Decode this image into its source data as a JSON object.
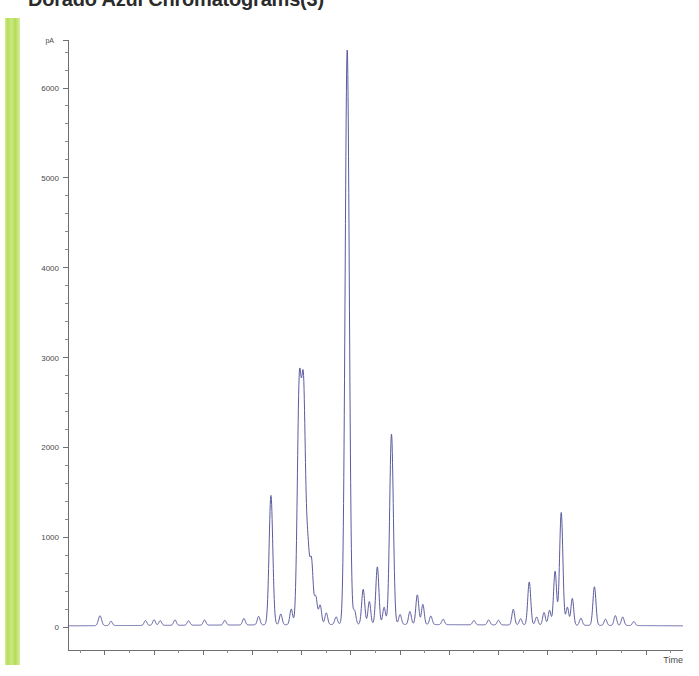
{
  "slide": {
    "title": "Dorado Azul Chromatograms(3)",
    "accent_color": "#b6de5e"
  },
  "chart_data": {
    "type": "line",
    "title": "Dorado Azul Chromatograms(3)",
    "xlabel": "Time",
    "ylabel": "pA",
    "y_unit": "pA",
    "trace_color": "#5b5b9e",
    "axis_color": "#6f6f6f",
    "grid": false,
    "legend": null,
    "xlim": [
      0,
      100
    ],
    "ylim": [
      -180,
      6700
    ],
    "ytick_labels": [
      "0",
      "1000",
      "2000",
      "3000",
      "4000",
      "5000",
      "6000"
    ],
    "yticks": [
      0,
      1000,
      2000,
      3000,
      4000,
      5000,
      6000
    ],
    "y_minor_tick_step": 200,
    "xticks": [
      2,
      6,
      10,
      14,
      18,
      22,
      26,
      30,
      34,
      38,
      42,
      46,
      50,
      54,
      58,
      62,
      66,
      70,
      74,
      78,
      82,
      86,
      90,
      94,
      98
    ],
    "xtick_labels": [],
    "x_major_every": 2,
    "baseline": 30,
    "peaks": [
      {
        "x": 5.2,
        "y": 110,
        "w": 0.35
      },
      {
        "x": 7.0,
        "y": 48,
        "w": 0.3
      },
      {
        "x": 12.6,
        "y": 55,
        "w": 0.3
      },
      {
        "x": 14.0,
        "y": 62,
        "w": 0.3
      },
      {
        "x": 15.0,
        "y": 52,
        "w": 0.3
      },
      {
        "x": 17.4,
        "y": 60,
        "w": 0.3
      },
      {
        "x": 19.6,
        "y": 50,
        "w": 0.3
      },
      {
        "x": 22.2,
        "y": 58,
        "w": 0.3
      },
      {
        "x": 25.5,
        "y": 52,
        "w": 0.3
      },
      {
        "x": 28.6,
        "y": 72,
        "w": 0.3
      },
      {
        "x": 31.0,
        "y": 95,
        "w": 0.3
      },
      {
        "x": 33.0,
        "y": 1440,
        "w": 0.4
      },
      {
        "x": 34.6,
        "y": 120,
        "w": 0.3
      },
      {
        "x": 36.3,
        "y": 175,
        "w": 0.3
      },
      {
        "x": 37.6,
        "y": 2580,
        "w": 0.42
      },
      {
        "x": 38.3,
        "y": 2550,
        "w": 0.42
      },
      {
        "x": 39.0,
        "y": 760,
        "w": 0.35
      },
      {
        "x": 39.6,
        "y": 690,
        "w": 0.35
      },
      {
        "x": 40.3,
        "y": 300,
        "w": 0.32
      },
      {
        "x": 41.0,
        "y": 215,
        "w": 0.32
      },
      {
        "x": 42.0,
        "y": 130,
        "w": 0.3
      },
      {
        "x": 43.6,
        "y": 85,
        "w": 0.3
      },
      {
        "x": 45.4,
        "y": 6400,
        "w": 0.45
      },
      {
        "x": 46.6,
        "y": 150,
        "w": 0.3
      },
      {
        "x": 48.0,
        "y": 390,
        "w": 0.33
      },
      {
        "x": 49.0,
        "y": 255,
        "w": 0.3
      },
      {
        "x": 50.3,
        "y": 640,
        "w": 0.34
      },
      {
        "x": 51.4,
        "y": 190,
        "w": 0.3
      },
      {
        "x": 52.6,
        "y": 2120,
        "w": 0.4
      },
      {
        "x": 54.0,
        "y": 110,
        "w": 0.3
      },
      {
        "x": 55.6,
        "y": 145,
        "w": 0.3
      },
      {
        "x": 56.8,
        "y": 330,
        "w": 0.32
      },
      {
        "x": 57.7,
        "y": 225,
        "w": 0.3
      },
      {
        "x": 59.0,
        "y": 95,
        "w": 0.3
      },
      {
        "x": 61.0,
        "y": 60,
        "w": 0.3
      },
      {
        "x": 66.0,
        "y": 48,
        "w": 0.3
      },
      {
        "x": 68.4,
        "y": 55,
        "w": 0.3
      },
      {
        "x": 70.0,
        "y": 52,
        "w": 0.3
      },
      {
        "x": 72.4,
        "y": 175,
        "w": 0.3
      },
      {
        "x": 73.6,
        "y": 70,
        "w": 0.3
      },
      {
        "x": 75.0,
        "y": 480,
        "w": 0.33
      },
      {
        "x": 76.2,
        "y": 90,
        "w": 0.3
      },
      {
        "x": 77.4,
        "y": 140,
        "w": 0.3
      },
      {
        "x": 78.3,
        "y": 165,
        "w": 0.3
      },
      {
        "x": 79.2,
        "y": 600,
        "w": 0.33
      },
      {
        "x": 80.2,
        "y": 1255,
        "w": 0.36
      },
      {
        "x": 81.2,
        "y": 200,
        "w": 0.3
      },
      {
        "x": 82.0,
        "y": 300,
        "w": 0.3
      },
      {
        "x": 83.4,
        "y": 80,
        "w": 0.3
      },
      {
        "x": 85.6,
        "y": 430,
        "w": 0.33
      },
      {
        "x": 87.4,
        "y": 70,
        "w": 0.3
      },
      {
        "x": 89.0,
        "y": 110,
        "w": 0.3
      },
      {
        "x": 90.2,
        "y": 95,
        "w": 0.3
      },
      {
        "x": 92.0,
        "y": 45,
        "w": 0.3
      }
    ]
  }
}
